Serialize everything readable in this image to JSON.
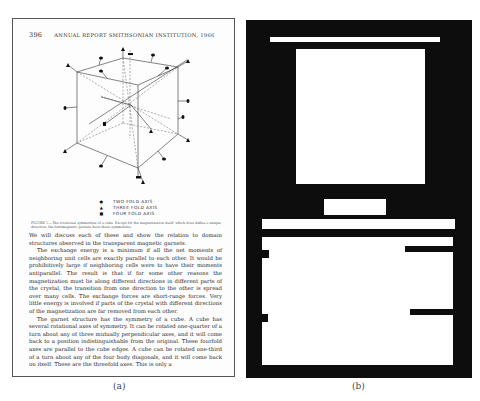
{
  "panel_a": {
    "label": "(a)",
    "page_header": {
      "page_number": "396",
      "running_title": "ANNUAL REPORT SMITHSONIAN INSTITUTION, 1966"
    },
    "figure": {
      "legend": [
        {
          "marker": "square-dot",
          "symbol": "●",
          "label": "TWO FOLD AXIS"
        },
        {
          "marker": "triangle",
          "symbol": "▲",
          "label": "THREE FOLD AXIS"
        },
        {
          "marker": "square",
          "symbol": "■",
          "label": "FOUR FOLD AXIS"
        }
      ],
      "caption": "FIGURE 5.—The rotational symmetries of a cube. Except for the magnetization itself, which does define a unique direction, the ferrimagnetic garnets have these symmetries."
    },
    "paragraphs": [
      "We will discuss each of these and show the relation to domain structures observed in the transparent magnetic garnets.",
      "The exchange energy is a minimum if all the net moments of neighboring unit cells are exactly parallel to each other. It would be prohibitively large if neighboring cells were to have their moments antiparallel. The result is that if for some other reasons the magnetization must lie along different directions in different parts of the crystal, the transition from one direction to the other is spread over many cells. The exchange forces are short-range forces. Very little energy is involved if parts of the crystal with different directions of the magnetization are far removed from each other.",
      "The garnet structure has the symmetry of a cube. A cube has several rotational axes of symmetry. It can be rotated one-quarter of a turn about any of three mutually perpendicular axes, and it will come back to a position indistinguishable from the original. These fourfold axes are parallel to the cube edges. A cube can be rotated one-third of a turn about any of the four body diagonals, and it will come back on itself. These are the threefold axes. This is only a"
    ]
  },
  "panel_b": {
    "label": "(b)",
    "description": "Binary layout mask of panel (a): white regions mark header, figure, legend, caption and text block on black background",
    "colors": {
      "background": "#0d0d0d",
      "region": "#ffffff"
    }
  }
}
